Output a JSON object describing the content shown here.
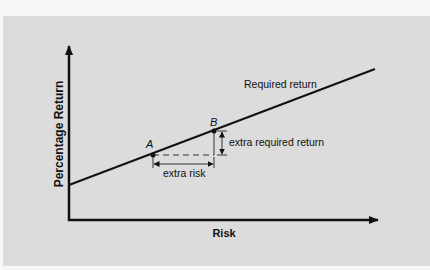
{
  "diagram": {
    "y_axis_label": "Percentage Return",
    "x_axis_label": "Risk",
    "line_label": "Required return",
    "point_a_label": "A",
    "point_b_label": "B",
    "extra_risk_label": "extra risk",
    "extra_return_label": "extra required return"
  },
  "colors": {
    "background": "#f7f7f7",
    "panel": "#dcdcdc",
    "ink": "#111111"
  }
}
